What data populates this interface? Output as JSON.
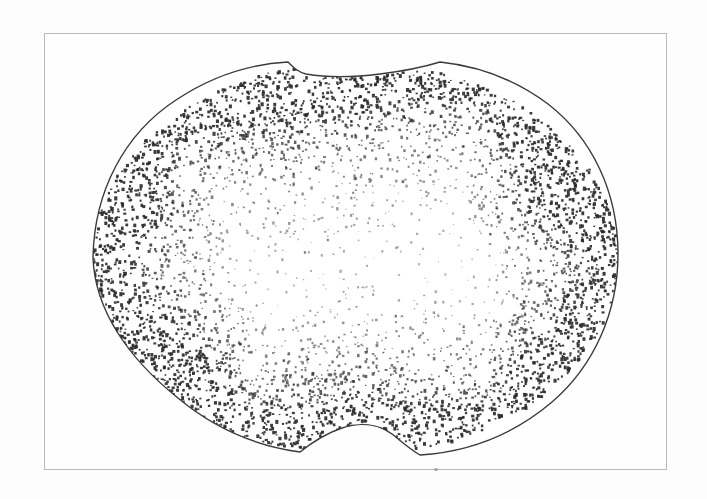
{
  "figure": {
    "plate": {
      "background_color": "#fdfdfd",
      "frame_color": "#b9b9b9",
      "frame_rect": {
        "x": 44,
        "y": 33,
        "width": 623,
        "height": 437
      }
    },
    "specimen": {
      "name": "stippled-cross-section",
      "outline_color": "#3a3a3a",
      "stipple_color": "#2b2b2b",
      "fill_color": "#ffffff",
      "bounds": {
        "left": 93,
        "top": 62,
        "right": 618,
        "bottom": 455
      },
      "top_peaks_x": [
        290,
        440
      ],
      "top_dip_y": 74,
      "bottom_notch_x": 395,
      "outline_path": "M 93 258 C 94 192 124 134 176 100 C 212 76 252 64 288 62 C 294 68 298 72 306 74 C 330 78 356 77 380 74 C 404 71 424 67 440 62 C 478 66 516 80 548 104 C 592 138 618 192 618 254 C 618 312 594 366 552 402 C 512 436 466 452 420 455 C 408 448 400 440 392 434 C 378 424 360 422 342 428 C 324 434 310 444 300 452 C 256 446 214 428 178 398 C 128 358 95 310 93 258 Z"
    },
    "texture": {
      "description": "dense ink stipple along the rim fading to sparse in the centre",
      "dense_zones": [
        "top-band",
        "lower-left-rim",
        "upper-right-rim",
        "bottom-centre-band"
      ],
      "sparse_zone": "centre",
      "dot_count": 7400
    },
    "marks": {
      "border_fleck": {
        "x": 434,
        "y": 468,
        "color": "#8b8b8b"
      }
    }
  }
}
